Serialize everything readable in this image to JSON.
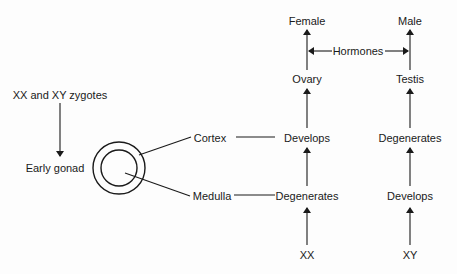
{
  "diagram": {
    "type": "flowchart",
    "title": "",
    "nodes": {
      "zygotes": "XX and XY zygotes",
      "early_gonad": "Early  gonad",
      "cortex": "Cortex",
      "medulla": "Medulla",
      "female": "Female",
      "male": "Male",
      "hormones": "Hormones",
      "ovary": "Ovary",
      "testis": "Testis",
      "xx_cortex_develops": "Develops",
      "xy_cortex_degenerates": "Degenerates",
      "xx_medulla_degenerates": "Degenerates",
      "xy_medulla_develops": "Develops",
      "xx": "XX",
      "xy": "XY"
    },
    "edges": [
      {
        "from": "zygotes",
        "to": "early_gonad",
        "style": "arrow"
      },
      {
        "from": "early_gonad_outer_ring",
        "to": "cortex",
        "style": "line"
      },
      {
        "from": "early_gonad_inner_circle",
        "to": "medulla",
        "style": "line"
      },
      {
        "from": "cortex",
        "to": "xx_cortex_develops",
        "style": "line"
      },
      {
        "from": "medulla",
        "to": "xx_medulla_degenerates",
        "style": "line"
      },
      {
        "from": "xx",
        "to": "xx_medulla_degenerates",
        "style": "arrow"
      },
      {
        "from": "xx_medulla_degenerates",
        "to": "xx_cortex_develops",
        "style": "arrow"
      },
      {
        "from": "xx_cortex_develops",
        "to": "ovary",
        "style": "arrow"
      },
      {
        "from": "ovary",
        "to": "female",
        "style": "arrow"
      },
      {
        "from": "xy",
        "to": "xy_medulla_develops",
        "style": "arrow"
      },
      {
        "from": "xy_medulla_develops",
        "to": "xy_cortex_degenerates",
        "style": "arrow"
      },
      {
        "from": "xy_cortex_degenerates",
        "to": "testis",
        "style": "arrow"
      },
      {
        "from": "testis",
        "to": "male",
        "style": "arrow"
      },
      {
        "from": "hormones",
        "to": "female_path",
        "style": "arrow"
      },
      {
        "from": "hormones",
        "to": "male_path",
        "style": "arrow"
      }
    ],
    "colors": {
      "ink": "#1a1a1a",
      "background": "#fdfdfd"
    }
  }
}
